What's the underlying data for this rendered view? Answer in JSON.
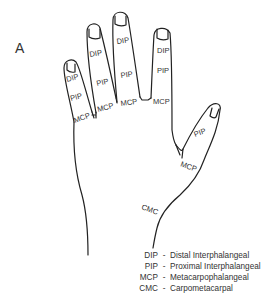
{
  "figure": {
    "panel_label": "A",
    "line_color": "#222222",
    "fingers": [
      {
        "name": "little",
        "labels": [
          "DIP",
          "PIP",
          "MCP"
        ]
      },
      {
        "name": "ring",
        "labels": [
          "DIP",
          "PIP",
          "MCP"
        ]
      },
      {
        "name": "middle",
        "labels": [
          "DIP",
          "PIP",
          "MCP"
        ]
      },
      {
        "name": "index",
        "labels": [
          "DIP",
          "PIP",
          "MCP"
        ]
      }
    ],
    "thumb": {
      "labels": [
        "PIP",
        "MCP",
        "CMC"
      ]
    }
  },
  "legend": {
    "items": [
      {
        "abbr": "DIP",
        "sep": "-",
        "term": "Distal Interphalangeal"
      },
      {
        "abbr": "PIP",
        "sep": "-",
        "term": "Proximal Interphalangeal"
      },
      {
        "abbr": "MCP",
        "sep": "-",
        "term": "Metacarpophalangeal"
      },
      {
        "abbr": "CMC",
        "sep": "-",
        "term": "Carpometacarpal"
      }
    ]
  }
}
